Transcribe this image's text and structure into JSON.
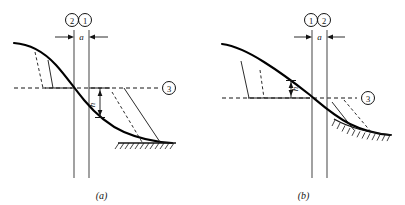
{
  "figure": {
    "type": "engineering-diagram",
    "panels": [
      {
        "id": "a",
        "caption": "(a)",
        "vertical_line_labels": [
          "2",
          "1"
        ],
        "horizontal_line_label": "3",
        "dimension_horizontal": "a",
        "dimension_vertical": "h",
        "h_position": "below-datum-right-of-center"
      },
      {
        "id": "b",
        "caption": "(b)",
        "vertical_line_labels": [
          "1",
          "2"
        ],
        "horizontal_line_label": "3",
        "dimension_horizontal": "a",
        "dimension_vertical": "h",
        "h_position": "above-datum-left-of-center"
      }
    ]
  },
  "colors": {
    "ink": "#141414",
    "curve": "#000000",
    "thin": "#3a3a3a",
    "background": "#ffffff"
  }
}
